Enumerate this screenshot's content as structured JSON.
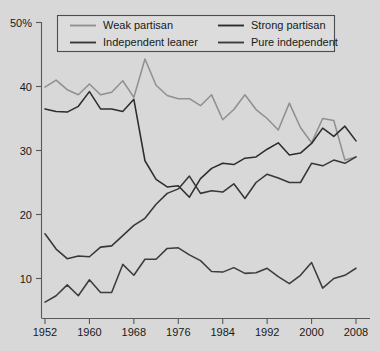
{
  "chart_data": {
    "type": "line",
    "title": "",
    "subtitle": "",
    "xlabel": "",
    "ylabel": "",
    "xlim": [
      1952,
      2008
    ],
    "ylim": [
      0,
      50
    ],
    "grid": false,
    "legend_position": "top-center",
    "y_ticks": [
      {
        "value": 50,
        "label": "50%"
      },
      {
        "value": 40,
        "label": "40"
      },
      {
        "value": 30,
        "label": "30"
      },
      {
        "value": 20,
        "label": "20"
      },
      {
        "value": 10,
        "label": "10"
      }
    ],
    "x_ticks": [
      {
        "value": 1952,
        "label": "1952"
      },
      {
        "value": 1960,
        "label": "1960"
      },
      {
        "value": 1968,
        "label": "1968"
      },
      {
        "value": 1976,
        "label": "1976"
      },
      {
        "value": 1984,
        "label": "1984"
      },
      {
        "value": 1992,
        "label": "1992"
      },
      {
        "value": 2000,
        "label": "2000"
      },
      {
        "value": 2008,
        "label": "2008"
      }
    ],
    "x": [
      1952,
      1954,
      1956,
      1958,
      1960,
      1962,
      1964,
      1966,
      1968,
      1970,
      1972,
      1974,
      1976,
      1978,
      1980,
      1982,
      1984,
      1986,
      1988,
      1990,
      1992,
      1994,
      1996,
      1998,
      2000,
      2002,
      2004,
      2006,
      2008
    ],
    "series": [
      {
        "name": "Weak partisan",
        "color": "#8e9092",
        "values": [
          39.9,
          41.0,
          39.5,
          38.7,
          40.4,
          38.7,
          39.1,
          40.9,
          38.3,
          44.3,
          40.2,
          38.6,
          38.1,
          38.1,
          37.0,
          38.7,
          34.8,
          36.4,
          38.7,
          36.4,
          35.0,
          33.2,
          37.4,
          33.6,
          31.2,
          35.0,
          34.7,
          28.5,
          29.0
        ]
      },
      {
        "name": "Strong partisan",
        "color": "#2b2d2f",
        "values": [
          36.5,
          36.1,
          36.0,
          36.9,
          39.2,
          36.5,
          36.5,
          36.1,
          38.0,
          28.4,
          25.5,
          24.3,
          24.5,
          22.7,
          25.6,
          27.2,
          28.0,
          27.8,
          28.8,
          29.0,
          30.2,
          31.2,
          29.3,
          29.6,
          31.1,
          33.5,
          32.2,
          33.8,
          31.5
        ]
      },
      {
        "name": "Independent leaner",
        "color": "#35383a",
        "values": [
          17.0,
          14.6,
          13.1,
          13.5,
          13.4,
          14.9,
          15.1,
          16.7,
          18.3,
          19.4,
          21.6,
          23.3,
          24.0,
          26.0,
          23.3,
          23.7,
          23.5,
          24.8,
          22.5,
          25.0,
          26.3,
          25.7,
          25.0,
          25.0,
          28.0,
          27.6,
          28.5,
          28.0,
          29.0
        ]
      },
      {
        "name": "Pure independent",
        "color": "#3a3d3f",
        "values": [
          6.3,
          7.3,
          9.0,
          7.3,
          9.8,
          7.8,
          7.8,
          12.2,
          10.5,
          13.0,
          13.0,
          14.7,
          14.8,
          13.7,
          12.8,
          11.1,
          11.0,
          11.7,
          10.8,
          10.9,
          11.6,
          10.3,
          9.2,
          10.5,
          12.5,
          8.5,
          10.0,
          10.5,
          11.6
        ]
      }
    ]
  },
  "legend": {
    "entries": [
      {
        "label": "Weak partisan",
        "color": "#8e9092"
      },
      {
        "label": "Strong partisan",
        "color": "#2b2d2f"
      },
      {
        "label": "Independent leaner",
        "color": "#35383a"
      },
      {
        "label": "Pure independent",
        "color": "#3a3d3f"
      }
    ]
  },
  "colors": {
    "background": "#d8d8d8",
    "axis": "#55595c",
    "text": "#17191b",
    "legend_background": "#dcdcdc",
    "legend_border": "#4a4e51"
  }
}
